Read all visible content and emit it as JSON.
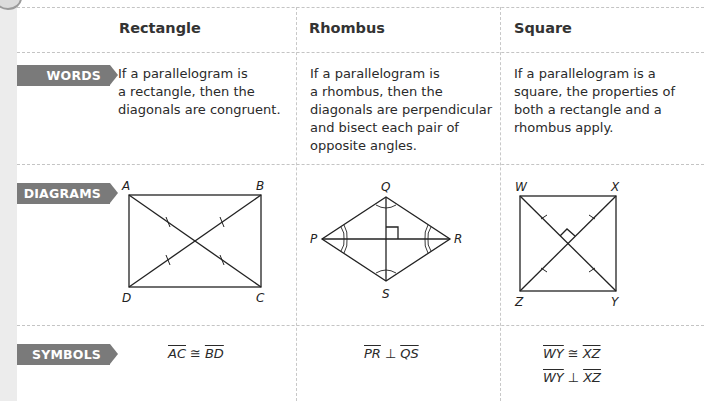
{
  "columns": [
    {
      "id": "rectangle",
      "title": "Rectangle"
    },
    {
      "id": "rhombus",
      "title": "Rhombus"
    },
    {
      "id": "square",
      "title": "Square"
    }
  ],
  "rows": {
    "words": {
      "label": "WORDS",
      "rectangle": [
        "If a parallelogram is",
        "a rectangle, then the",
        "diagonals are congruent."
      ],
      "rhombus": [
        "If a parallelogram is",
        "a rhombus, then the",
        "diagonals are perpendicular",
        "and bisect each pair of",
        "opposite angles."
      ],
      "square": [
        "If a parallelogram is a",
        "square, the properties of",
        "both a rectangle and a",
        "rhombus apply."
      ]
    },
    "diagrams": {
      "label": "DIAGRAMS",
      "rectangle": {
        "vertices": [
          "A",
          "B",
          "C",
          "D"
        ]
      },
      "rhombus": {
        "vertices": [
          "Q",
          "R",
          "S",
          "P"
        ]
      },
      "square": {
        "vertices": [
          "W",
          "X",
          "Y",
          "Z"
        ]
      }
    },
    "symbols": {
      "label": "SYMBOLS",
      "rectangle": [
        {
          "left": "AC",
          "op": "≅",
          "right": "BD"
        }
      ],
      "rhombus": [
        {
          "left": "PR",
          "op": "⊥",
          "right": "QS"
        }
      ],
      "square": [
        {
          "left": "WY",
          "op": "≅",
          "right": "XZ"
        },
        {
          "left": "WY",
          "op": "⊥",
          "right": "XZ"
        }
      ]
    }
  },
  "colors": {
    "banner": "#7a7a7a",
    "strip": "#ececec",
    "divider": "#c4c4c4"
  }
}
